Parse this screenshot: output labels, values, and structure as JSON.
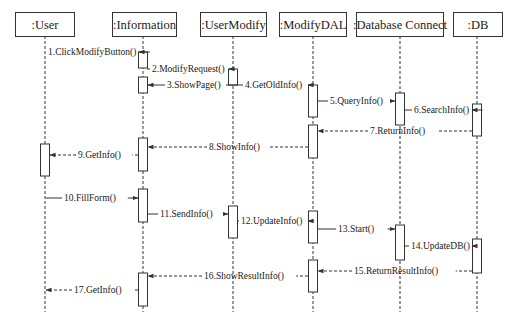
{
  "diagram": {
    "type": "sequence",
    "colors": {
      "line": "#333333",
      "background": "#ffffff",
      "box_fill": "#ffffff"
    },
    "lifelines": [
      {
        "id": "user",
        "label": ":User",
        "x": 45,
        "box": [
          15,
          12,
          59,
          24
        ]
      },
      {
        "id": "information",
        "label": ":Information",
        "x": 143,
        "box": [
          112,
          12,
          64,
          24
        ]
      },
      {
        "id": "usermodify",
        "label": ":UserModify",
        "x": 233,
        "box": [
          200,
          12,
          66,
          24
        ]
      },
      {
        "id": "modifydal",
        "label": ":ModifyDAL",
        "x": 313,
        "box": [
          279,
          12,
          67,
          24
        ]
      },
      {
        "id": "dbconnect",
        "label": ":Database Connect",
        "x": 400,
        "box": [
          356,
          12,
          87,
          24
        ]
      },
      {
        "id": "db",
        "label": ":DB",
        "x": 477,
        "box": [
          453,
          12,
          49,
          24
        ]
      }
    ],
    "activations": [
      {
        "lifeline": "information",
        "y1": 52,
        "y2": 68
      },
      {
        "lifeline": "usermodify",
        "y1": 69,
        "y2": 85
      },
      {
        "lifeline": "information",
        "y1": 77,
        "y2": 93
      },
      {
        "lifeline": "modifydal",
        "y1": 85,
        "y2": 117
      },
      {
        "lifeline": "dbconnect",
        "y1": 93,
        "y2": 125
      },
      {
        "lifeline": "db",
        "y1": 104,
        "y2": 136
      },
      {
        "lifeline": "modifydal",
        "y1": 125,
        "y2": 158
      },
      {
        "lifeline": "information",
        "y1": 138,
        "y2": 171
      },
      {
        "lifeline": "user",
        "y1": 144,
        "y2": 176
      },
      {
        "lifeline": "information",
        "y1": 189,
        "y2": 222
      },
      {
        "lifeline": "usermodify",
        "y1": 206,
        "y2": 238
      },
      {
        "lifeline": "modifydal",
        "y1": 211,
        "y2": 243
      },
      {
        "lifeline": "dbconnect",
        "y1": 225,
        "y2": 260
      },
      {
        "lifeline": "db",
        "y1": 239,
        "y2": 273
      },
      {
        "lifeline": "modifydal",
        "y1": 260,
        "y2": 292
      },
      {
        "lifeline": "information",
        "y1": 273,
        "y2": 306
      }
    ],
    "messages": [
      {
        "n": 1,
        "label": "1.ClickModifyButton()",
        "x1": 46,
        "x2": 139,
        "y": 52,
        "style": "solid",
        "label_x": 48,
        "label_anchor": "start"
      },
      {
        "n": 2,
        "label": "2.ModifyRequest()",
        "x1": 147,
        "x2": 229,
        "y": 69,
        "style": "solid",
        "label_x": 152,
        "label_anchor": "start",
        "from_side": true
      },
      {
        "n": 3,
        "label": "3.ShowPage()",
        "x1": 237,
        "x2": 148,
        "y": 85,
        "style": "solid",
        "label_x": 167,
        "label_anchor": "start"
      },
      {
        "n": 4,
        "label": "4.GetOldInfo()",
        "x1": 237,
        "x2": 308,
        "y": 85,
        "style": "solid",
        "label_x": 245,
        "label_anchor": "start"
      },
      {
        "n": 5,
        "label": "5.QueryInfo()",
        "x1": 318,
        "x2": 395,
        "y": 101,
        "style": "solid",
        "label_x": 330,
        "label_anchor": "start"
      },
      {
        "n": 6,
        "label": "6.SearchInfo()",
        "x1": 405,
        "x2": 472,
        "y": 110,
        "style": "solid",
        "label_x": 414,
        "label_anchor": "start"
      },
      {
        "n": 7,
        "label": "7.ReturnInfo()",
        "x1": 472,
        "x2": 318,
        "y": 131,
        "style": "dashed",
        "label_x": 370,
        "label_anchor": "start"
      },
      {
        "n": 8,
        "label": "8.ShowInfo()",
        "x1": 308,
        "x2": 148,
        "y": 147,
        "style": "dashed",
        "label_x": 209,
        "label_anchor": "start"
      },
      {
        "n": 9,
        "label": "9.GetInfo()",
        "x1": 138,
        "x2": 50,
        "y": 155,
        "style": "dashed",
        "label_x": 78,
        "label_anchor": "start"
      },
      {
        "n": 10,
        "label": "10.FillForm()",
        "x1": 46,
        "x2": 138,
        "y": 198,
        "style": "solid",
        "label_x": 64,
        "label_anchor": "start"
      },
      {
        "n": 11,
        "label": "11.SendInfo()",
        "x1": 148,
        "x2": 228,
        "y": 214,
        "style": "solid",
        "label_x": 160,
        "label_anchor": "start"
      },
      {
        "n": 12,
        "label": "12.UpdateInfo()",
        "x1": 238,
        "x2": 308,
        "y": 221,
        "style": "solid",
        "label_x": 241,
        "label_anchor": "start"
      },
      {
        "n": 13,
        "label": "13.Start()",
        "x1": 318,
        "x2": 395,
        "y": 229,
        "style": "solid",
        "label_x": 338,
        "label_anchor": "start"
      },
      {
        "n": 14,
        "label": "14.UpdateDB()",
        "x1": 405,
        "x2": 472,
        "y": 246,
        "style": "solid",
        "label_x": 411,
        "label_anchor": "start"
      },
      {
        "n": 15,
        "label": "15.ReturnResultInfo()",
        "x1": 472,
        "x2": 318,
        "y": 271,
        "style": "dashed",
        "label_x": 354,
        "label_anchor": "start"
      },
      {
        "n": 16,
        "label": "16.ShowResultInfo()",
        "x1": 308,
        "x2": 148,
        "y": 276,
        "style": "dashed",
        "label_x": 204,
        "label_anchor": "start"
      },
      {
        "n": 17,
        "label": "17.GetInfo()",
        "x1": 138,
        "x2": 46,
        "y": 290,
        "style": "dashed",
        "label_x": 74,
        "label_anchor": "start"
      }
    ],
    "lifeline_end_y": 312
  }
}
